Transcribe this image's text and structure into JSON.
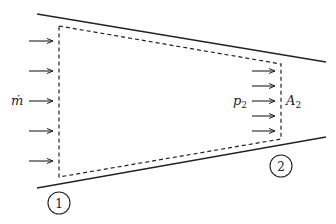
{
  "diagram": {
    "type": "control-volume-nozzle",
    "labels": {
      "mass_flow": "ṁ",
      "pressure_exit": "p",
      "pressure_exit_sub": "2",
      "area_exit": "A",
      "area_exit_sub": "2",
      "station_1": "1",
      "station_2": "2"
    },
    "colors": {
      "stroke": "#222222",
      "background": "#ffffff"
    },
    "inlet_arrow_count": 5,
    "outlet_arrow_count": 5
  }
}
